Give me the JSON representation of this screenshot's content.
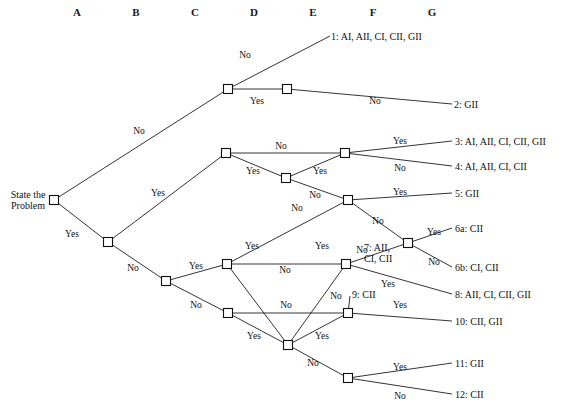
{
  "diagram": {
    "root_label": "State the\nProblem",
    "line_color": "#111111",
    "node_fill": "#ffffff",
    "background": "#ffffff"
  },
  "columns": [
    {
      "label": "A",
      "x": 77
    },
    {
      "label": "B",
      "x": 136
    },
    {
      "label": "C",
      "x": 195
    },
    {
      "label": "D",
      "x": 254
    },
    {
      "label": "E",
      "x": 313
    },
    {
      "label": "F",
      "x": 373
    },
    {
      "label": "G",
      "x": 432
    }
  ],
  "nodes": [
    {
      "id": "A1",
      "x": 54,
      "y": 200
    },
    {
      "id": "B1",
      "x": 108,
      "y": 242
    },
    {
      "id": "C1",
      "x": 166,
      "y": 281
    },
    {
      "id": "D1",
      "x": 228,
      "y": 89
    },
    {
      "id": "D2",
      "x": 226,
      "y": 153
    },
    {
      "id": "D3",
      "x": 227,
      "y": 264
    },
    {
      "id": "D4",
      "x": 228,
      "y": 313
    },
    {
      "id": "E1",
      "x": 287,
      "y": 89
    },
    {
      "id": "E2",
      "x": 286,
      "y": 178
    },
    {
      "id": "E3",
      "x": 288,
      "y": 345
    },
    {
      "id": "F1",
      "x": 345,
      "y": 153
    },
    {
      "id": "F2",
      "x": 348,
      "y": 200
    },
    {
      "id": "F3",
      "x": 346,
      "y": 264
    },
    {
      "id": "F4",
      "x": 348,
      "y": 313
    },
    {
      "id": "F5",
      "x": 348,
      "y": 378
    },
    {
      "id": "G1",
      "x": 408,
      "y": 243
    }
  ],
  "edges": [
    {
      "from": "A1",
      "to": "D1",
      "label": "No",
      "lx": 139,
      "ly": 131
    },
    {
      "from": "A1",
      "to": "B1",
      "label": "Yes",
      "lx": 72,
      "ly": 234
    },
    {
      "from": "D1",
      "to": "E1",
      "label": "Yes",
      "lx": 257,
      "ly": 101
    },
    {
      "from": "B1",
      "to": "D2",
      "label": "Yes",
      "lx": 158,
      "ly": 193
    },
    {
      "from": "B1",
      "to": "C1",
      "label": "No",
      "lx": 133,
      "ly": 268
    },
    {
      "from": "D2",
      "to": "F1",
      "label": "No",
      "lx": 281,
      "ly": 146
    },
    {
      "from": "D2",
      "to": "E2",
      "label": "Yes",
      "lx": 253,
      "ly": 171
    },
    {
      "from": "E2",
      "to": "F1",
      "label": "Yes",
      "lx": 320,
      "ly": 171
    },
    {
      "from": "E2",
      "to": "F2",
      "label": "No",
      "lx": 315,
      "ly": 195
    },
    {
      "from": "C1",
      "to": "D3",
      "label": "Yes",
      "lx": 196,
      "ly": 266
    },
    {
      "from": "C1",
      "to": "D4",
      "label": "No",
      "lx": 196,
      "ly": 305
    },
    {
      "from": "D3",
      "to": "F2",
      "label": "No",
      "lx": 297,
      "ly": 208
    },
    {
      "from": "D3",
      "to": "F3",
      "label": "No",
      "lx": 285,
      "ly": 270
    },
    {
      "from": "F2",
      "to": "G1",
      "label": "No",
      "lx": 378,
      "ly": 221
    },
    {
      "from": "F3",
      "to": "G1",
      "label": "No",
      "lx": 362,
      "ly": 250
    },
    {
      "from": "D3",
      "to": "E3",
      "label": "Yes",
      "lx": 252,
      "ly": 246
    },
    {
      "from": "E3",
      "to": "F3",
      "label": "Yes",
      "lx": 322,
      "ly": 246
    },
    {
      "from": "D4",
      "to": "F4",
      "label": "No",
      "lx": 286,
      "ly": 305
    },
    {
      "from": "D4",
      "to": "E3",
      "label": "Yes",
      "lx": 254,
      "ly": 336
    },
    {
      "from": "E3",
      "to": "F4",
      "label": "Yes",
      "lx": 322,
      "ly": 336
    },
    {
      "from": "E3",
      "to": "F5",
      "label": "No",
      "lx": 313,
      "ly": 363
    },
    {
      "from": "F4",
      "to": "out9",
      "label": "No",
      "lx": 336,
      "ly": 296
    },
    {
      "from": "F4",
      "to": "out10",
      "label": "Yes",
      "lx": 400,
      "ly": 305
    },
    {
      "from": "F3",
      "to": "out8",
      "label": "Yes",
      "lx": 388,
      "ly": 284
    },
    {
      "from": "F1",
      "to": "out3",
      "label": "Yes",
      "lx": 400,
      "ly": 141
    },
    {
      "from": "F1",
      "to": "out4",
      "label": "No",
      "lx": 400,
      "ly": 168
    },
    {
      "from": "F2",
      "to": "out5",
      "label": "Yes",
      "lx": 400,
      "ly": 192
    },
    {
      "from": "G1",
      "to": "out6a",
      "label": "Yes",
      "lx": 434,
      "ly": 232
    },
    {
      "from": "G1",
      "to": "out6b",
      "label": "No",
      "lx": 434,
      "ly": 262
    },
    {
      "from": "F5",
      "to": "out11",
      "label": "Yes",
      "lx": 400,
      "ly": 367
    },
    {
      "from": "F5",
      "to": "out12",
      "label": "No",
      "lx": 400,
      "ly": 396
    },
    {
      "from": "D1",
      "to": "out1",
      "label": "No",
      "lx": 245,
      "ly": 55
    },
    {
      "from": "E1",
      "to": "out2",
      "label": "No",
      "lx": 375,
      "ly": 101
    }
  ],
  "outcomes": [
    {
      "id": "out1",
      "text": "1:  AI, AII, CI, CII, GII",
      "x": 331,
      "y": 36,
      "tip_x": 330,
      "tip_y": 36
    },
    {
      "id": "out2",
      "text": "2: GII",
      "x": 454,
      "y": 104,
      "tip_x": 452,
      "tip_y": 104
    },
    {
      "id": "out3",
      "text": "3:  AI, AII, CI, CII, GII",
      "x": 455,
      "y": 141,
      "tip_x": 452,
      "tip_y": 141
    },
    {
      "id": "out4",
      "text": "4: AI, AII, CI, CII",
      "x": 455,
      "y": 166,
      "tip_x": 452,
      "tip_y": 166
    },
    {
      "id": "out5",
      "text": "5: GII",
      "x": 455,
      "y": 193,
      "tip_x": 452,
      "tip_y": 193
    },
    {
      "id": "out6a",
      "text": "6a: CII",
      "x": 455,
      "y": 228,
      "tip_x": 452,
      "tip_y": 228
    },
    {
      "id": "out6b",
      "text": "6b: CI, CII",
      "x": 455,
      "y": 267,
      "tip_x": 452,
      "tip_y": 267
    },
    {
      "id": "out8",
      "text": "8: AII, CI, CII, GII",
      "x": 455,
      "y": 294,
      "tip_x": 452,
      "tip_y": 294
    },
    {
      "id": "out10",
      "text": "10: CII, GII",
      "x": 455,
      "y": 321,
      "tip_x": 452,
      "tip_y": 321
    },
    {
      "id": "out11",
      "text": "11: GII",
      "x": 455,
      "y": 363,
      "tip_x": 452,
      "tip_y": 363
    },
    {
      "id": "out12",
      "text": "12: CII",
      "x": 455,
      "y": 394,
      "tip_x": 452,
      "tip_y": 394
    }
  ],
  "inline_outcomes": [
    {
      "id": "out7",
      "text": "7: AII,\nCI, CII",
      "x": 364,
      "y": 253,
      "tip_x": 362,
      "tip_y": 248
    },
    {
      "id": "out9",
      "text": "9: CII",
      "x": 352,
      "y": 295,
      "tip_x": 350,
      "tip_y": 296
    }
  ],
  "caption": ""
}
